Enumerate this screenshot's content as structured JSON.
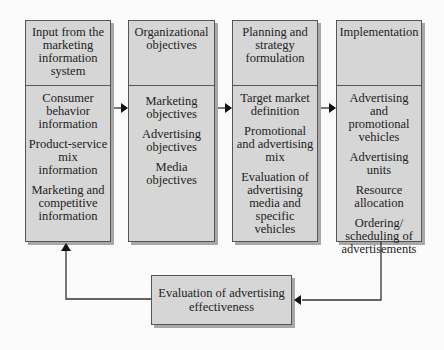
{
  "diagram": {
    "columns": [
      {
        "header": "Input from the marketing information system",
        "items": [
          "Consumer behavior information",
          "Product-service mix information",
          "Marketing and competitive information"
        ]
      },
      {
        "header": "Organizational objectives",
        "items": [
          "Marketing objectives",
          "Advertising objectives",
          "Media objectives"
        ]
      },
      {
        "header": "Planning and strategy formulation",
        "items": [
          "Target market definition",
          "Promotional and advertising mix",
          "Evaluation of advertising media and specific vehicles"
        ]
      },
      {
        "header": "Implementation",
        "items": [
          "Advertising and promotional vehicles",
          "Advertising units",
          "Resource allocation",
          "Ordering/ scheduling of advertisements"
        ]
      }
    ],
    "feedback": {
      "label": "Evaluation of advertising effectiveness"
    },
    "colors": {
      "box_fill": "#d6d6d6",
      "box_border": "#555555",
      "shadow": "#a8a8a8",
      "arrow": "#333333",
      "background": "#fbfbfb"
    }
  }
}
